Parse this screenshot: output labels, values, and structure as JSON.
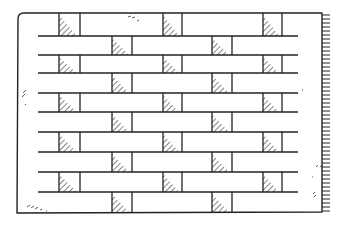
{
  "drawing": {
    "title": "Hand-drawn brick wall sketch",
    "stroke_color": "#222222",
    "background_color": "#ffffff",
    "frame": {
      "left": 18,
      "top": 13,
      "right": 322,
      "bottom": 212
    },
    "row_lines_y": [
      36,
      55,
      73,
      93,
      112,
      132,
      152,
      172,
      192
    ],
    "row_line_left": 38,
    "row_line_right": 298,
    "rows": [
      {
        "top": 13,
        "bottom": 36,
        "blocks": [
          [
            59,
            80
          ],
          [
            163,
            182
          ],
          [
            263,
            282
          ]
        ]
      },
      {
        "top": 36,
        "bottom": 55,
        "blocks": [
          [
            112,
            132
          ],
          [
            212,
            232
          ]
        ]
      },
      {
        "top": 55,
        "bottom": 73,
        "blocks": [
          [
            59,
            80
          ],
          [
            163,
            182
          ],
          [
            263,
            282
          ]
        ]
      },
      {
        "top": 73,
        "bottom": 93,
        "blocks": [
          [
            112,
            132
          ],
          [
            212,
            232
          ]
        ]
      },
      {
        "top": 93,
        "bottom": 112,
        "blocks": [
          [
            59,
            80
          ],
          [
            163,
            182
          ],
          [
            263,
            282
          ]
        ]
      },
      {
        "top": 112,
        "bottom": 132,
        "blocks": [
          [
            112,
            132
          ],
          [
            212,
            232
          ]
        ]
      },
      {
        "top": 132,
        "bottom": 152,
        "blocks": [
          [
            59,
            80
          ],
          [
            163,
            182
          ],
          [
            263,
            282
          ]
        ]
      },
      {
        "top": 152,
        "bottom": 172,
        "blocks": [
          [
            112,
            132
          ],
          [
            212,
            232
          ]
        ]
      },
      {
        "top": 172,
        "bottom": 192,
        "blocks": [
          [
            59,
            80
          ],
          [
            163,
            182
          ],
          [
            263,
            282
          ]
        ]
      },
      {
        "top": 192,
        "bottom": 212,
        "blocks": [
          [
            112,
            132
          ],
          [
            212,
            232
          ]
        ]
      }
    ],
    "edge_ticks": {
      "x": 322,
      "length": 8,
      "from_y": 15,
      "to_y": 212,
      "spacing": 4
    }
  }
}
